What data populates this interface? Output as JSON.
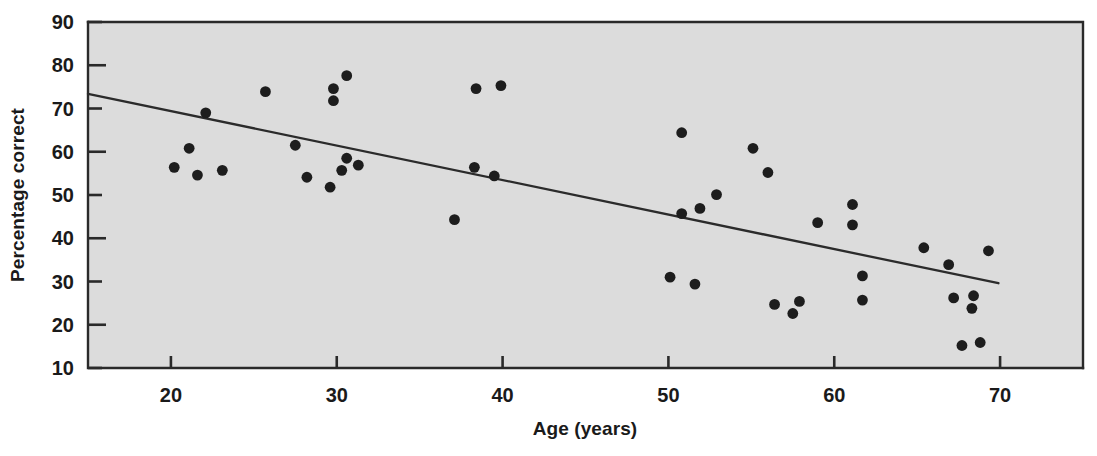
{
  "chart_data": {
    "type": "scatter",
    "title": "",
    "xlabel": "Age (years)",
    "ylabel": "Percentage correct",
    "xlim": [
      15,
      75
    ],
    "ylim": [
      10,
      90
    ],
    "xticks": [
      20,
      30,
      40,
      50,
      60,
      70
    ],
    "xtick_labels": [
      "20",
      "30",
      "40",
      "50",
      "60",
      "70"
    ],
    "yticks": [
      10,
      20,
      30,
      40,
      50,
      60,
      70,
      80,
      90
    ],
    "ytick_labels": [
      "10",
      "20",
      "30",
      "40",
      "50",
      "60",
      "70",
      "80",
      "90"
    ],
    "grid": false,
    "legend": null,
    "plot_background_color": "#dcdcdc",
    "point_color": "#1d1d1d",
    "line_color": "#2b2b2b",
    "series": [
      {
        "name": "Participants",
        "marker": "circle",
        "points": [
          [
            20.2,
            56.4
          ],
          [
            21.1,
            60.8
          ],
          [
            21.6,
            54.6
          ],
          [
            22.1,
            69.0
          ],
          [
            23.1,
            55.7
          ],
          [
            25.7,
            73.9
          ],
          [
            27.5,
            61.5
          ],
          [
            28.2,
            54.1
          ],
          [
            29.6,
            51.8
          ],
          [
            29.8,
            74.6
          ],
          [
            29.8,
            71.8
          ],
          [
            30.3,
            55.7
          ],
          [
            30.6,
            77.6
          ],
          [
            30.6,
            58.5
          ],
          [
            31.3,
            56.9
          ],
          [
            37.1,
            44.3
          ],
          [
            38.3,
            56.4
          ],
          [
            38.4,
            74.6
          ],
          [
            39.5,
            54.4
          ],
          [
            39.9,
            75.3
          ],
          [
            50.1,
            31.0
          ],
          [
            50.8,
            64.4
          ],
          [
            50.8,
            45.7
          ],
          [
            51.6,
            29.4
          ],
          [
            51.9,
            46.9
          ],
          [
            52.9,
            50.1
          ],
          [
            55.1,
            60.8
          ],
          [
            56.0,
            55.2
          ],
          [
            56.4,
            24.7
          ],
          [
            57.5,
            22.6
          ],
          [
            57.9,
            25.4
          ],
          [
            59.0,
            43.6
          ],
          [
            61.1,
            47.8
          ],
          [
            61.1,
            43.1
          ],
          [
            61.7,
            31.3
          ],
          [
            61.7,
            25.7
          ],
          [
            65.4,
            37.8
          ],
          [
            66.9,
            33.9
          ],
          [
            67.2,
            26.2
          ],
          [
            67.7,
            15.2
          ],
          [
            68.3,
            23.8
          ],
          [
            68.4,
            26.7
          ],
          [
            68.8,
            15.9
          ],
          [
            69.3,
            37.1
          ]
        ]
      }
    ],
    "trend_line": {
      "name": "Regression line",
      "x_start": 15.0,
      "y_start": 73.4,
      "x_end": 69.9,
      "y_end": 29.6
    }
  }
}
